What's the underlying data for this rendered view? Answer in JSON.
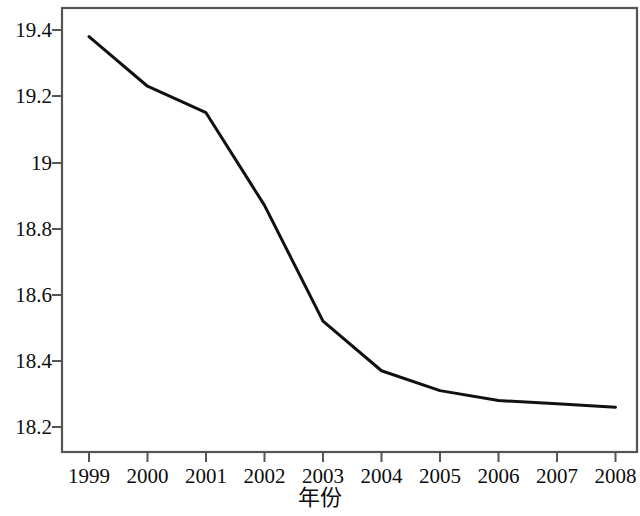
{
  "chart_data": {
    "type": "line",
    "title": "",
    "subtitle": "",
    "xlabel": "年份",
    "ylabel": "",
    "categories": [
      "1999",
      "2000",
      "2001",
      "2002",
      "2003",
      "2004",
      "2005",
      "2006",
      "2007",
      "2008"
    ],
    "x": [
      1999,
      2000,
      2001,
      2002,
      2003,
      2004,
      2005,
      2006,
      2007,
      2008
    ],
    "values": [
      19.38,
      19.23,
      19.15,
      18.87,
      18.52,
      18.37,
      18.31,
      18.28,
      18.27,
      18.26
    ],
    "series": [
      {
        "name": "",
        "values": [
          19.38,
          19.23,
          19.15,
          18.87,
          18.52,
          18.37,
          18.31,
          18.28,
          18.27,
          18.26
        ]
      }
    ],
    "xlim": [
      1998.54,
      2008.46
    ],
    "ylim": [
      18.12,
      19.47
    ],
    "yticks": [
      18.2,
      18.4,
      18.6,
      18.8,
      19.0,
      19.2,
      19.4
    ],
    "ytick_labels": [
      "18.2",
      "18.4",
      "18.6",
      "18.8",
      "19",
      "19.2",
      "19.4"
    ],
    "xticks": [
      1999,
      2000,
      2001,
      2002,
      2003,
      2004,
      2005,
      2006,
      2007,
      2008
    ],
    "xtick_labels": [
      "1999",
      "2000",
      "2001",
      "2002",
      "2003",
      "2004",
      "2005",
      "2006",
      "2007",
      "2008"
    ],
    "grid": false,
    "legend": false,
    "legend_position": "none",
    "line_color": "#111111",
    "background_color": "#ffffff",
    "frame_color": "#555555",
    "annotations": []
  },
  "axes": {
    "x_title": "年份",
    "y_title": "",
    "y_labels": [
      "19.4",
      "19.2",
      "19",
      "18.8",
      "18.6",
      "18.4",
      "18.2"
    ],
    "x_labels": [
      "1999",
      "2000",
      "2001",
      "2002",
      "2003",
      "2004",
      "2005",
      "2006",
      "2007",
      "2008"
    ]
  }
}
